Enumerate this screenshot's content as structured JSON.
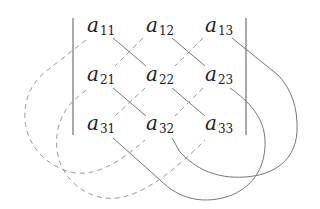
{
  "diagram": {
    "colors": {
      "bar": "#555555",
      "solid": "#777777",
      "dashed": "#999999",
      "text": "#222222"
    },
    "matrix": {
      "rows": [
        [
          {
            "base": "a",
            "sub": "11"
          },
          {
            "base": "a",
            "sub": "12"
          },
          {
            "base": "a",
            "sub": "13"
          }
        ],
        [
          {
            "base": "a",
            "sub": "21"
          },
          {
            "base": "a",
            "sub": "22"
          },
          {
            "base": "a",
            "sub": "23"
          }
        ],
        [
          {
            "base": "a",
            "sub": "31"
          },
          {
            "base": "a",
            "sub": "32"
          },
          {
            "base": "a",
            "sub": "33"
          }
        ]
      ]
    },
    "line_styles": {
      "solid": "positive diagonal products",
      "dashed": "negative anti-diagonal products"
    }
  }
}
